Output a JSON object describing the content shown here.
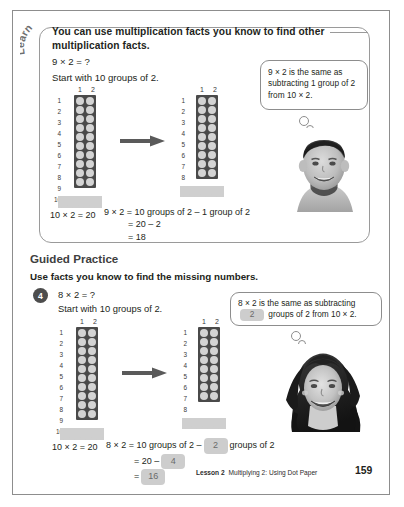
{
  "page": {
    "number": "159",
    "footer_lesson": "Lesson 2",
    "footer_title": "Multiplying 2: Using Dot Paper"
  },
  "learn": {
    "badge_label": "Learn",
    "heading": "You can use multiplication facts you know to find other multiplication facts.",
    "equation_prompt": "9 × 2 = ?",
    "start_line": "Start with 10 groups of 2.",
    "callout": "9 × 2 is the same as subtracting 1 group of 2 from 10 × 2.",
    "grid_left": {
      "col_headers": [
        "1",
        "2"
      ],
      "row_labels": [
        "1",
        "2",
        "3",
        "4",
        "5",
        "6",
        "7",
        "8",
        "9",
        "10"
      ],
      "rows": 10,
      "cols": 2,
      "caption": "10 × 2 = 20"
    },
    "grid_right": {
      "col_headers": [
        "1",
        "2"
      ],
      "row_labels": [
        "1",
        "2",
        "3",
        "4",
        "5",
        "6",
        "7",
        "8",
        "9"
      ],
      "rows": 9,
      "cols": 2
    },
    "solution": {
      "line1": "9 × 2 = 10 groups of 2 – 1 group of 2",
      "line2": "= 20 – 2",
      "line3": "= 18"
    },
    "photo_name": "boy-photo"
  },
  "guided_practice": {
    "title": "Guided Practice",
    "instruction": "Use facts you know to find the missing numbers.",
    "question_number": "4",
    "equation_prompt": "8 × 2 = ?",
    "start_line": "Start with 10 groups of 2.",
    "callout_pre": "8 × 2 is the same as subtracting",
    "callout_blank": "2",
    "callout_post": "groups of 2 from 10 × 2.",
    "grid_left": {
      "col_headers": [
        "1",
        "2"
      ],
      "row_labels": [
        "1",
        "2",
        "3",
        "4",
        "5",
        "6",
        "7",
        "8",
        "9",
        "10"
      ],
      "rows": 10,
      "cols": 2,
      "caption": "10 × 2 = 20"
    },
    "grid_right": {
      "col_headers": [
        "1",
        "2"
      ],
      "row_labels": [
        "1",
        "2",
        "3",
        "4",
        "5",
        "6",
        "7",
        "8"
      ],
      "rows": 8,
      "cols": 2
    },
    "solution": {
      "l1_pre": "8 × 2 = 10 groups of 2 –",
      "l1_blank": "2",
      "l1_post": "groups of 2",
      "l2_pre": "= 20 –",
      "l2_blank": "4",
      "l3_pre": "=",
      "l3_blank": "16"
    },
    "photo_name": "girl-photo"
  },
  "colors": {
    "page_border": "#8d8d8d",
    "grid_background": "#4a4a4a",
    "dot": "#d4d4d4",
    "blank_fill": "#cdcdcd",
    "torn_paper": "#cfcfcf",
    "qnum_badge": "#4d4d4d"
  }
}
